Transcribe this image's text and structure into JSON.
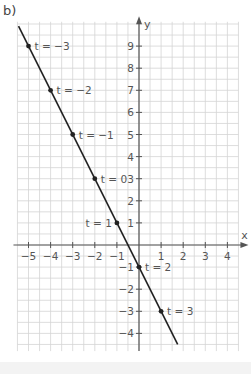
{
  "part_label": "b)",
  "chart_data": {
    "type": "line",
    "title": "",
    "xlabel": "x",
    "ylabel": "y",
    "xlim": [
      -5.5,
      4.5
    ],
    "ylim": [
      -4.5,
      9.9
    ],
    "grid": true,
    "grid_step": 0.5,
    "x_ticks": [
      -5,
      -4,
      -3,
      -2,
      -1,
      1,
      2,
      3,
      4
    ],
    "y_ticks": [
      -4,
      -3,
      -2,
      -1,
      1,
      2,
      3,
      4,
      5,
      6,
      7,
      8,
      9
    ],
    "series": [
      {
        "name": "parametric line (x = t - 2, y = -2t + 3)",
        "line_start": [
          -5.45,
          9.9
        ],
        "line_end": [
          1.75,
          -4.5
        ],
        "points": [
          {
            "t": -3,
            "label": "t = −3",
            "x": -5,
            "y": 9
          },
          {
            "t": -2,
            "label": "t = −2",
            "x": -4,
            "y": 7
          },
          {
            "t": -1,
            "label": "t = −1",
            "x": -3,
            "y": 5
          },
          {
            "t": 0,
            "label": "t = 0",
            "x": -2,
            "y": 3
          },
          {
            "t": 1,
            "label": "t = 1",
            "x": -1,
            "y": 1
          },
          {
            "t": 2,
            "label": "t = 2",
            "x": 0,
            "y": -1
          },
          {
            "t": 3,
            "label": "t = 3",
            "x": 1,
            "y": -3
          }
        ]
      }
    ],
    "colors": {
      "grid": "#d4d4d4",
      "axis": "#555555",
      "line": "#222222",
      "text": "#555555"
    }
  }
}
